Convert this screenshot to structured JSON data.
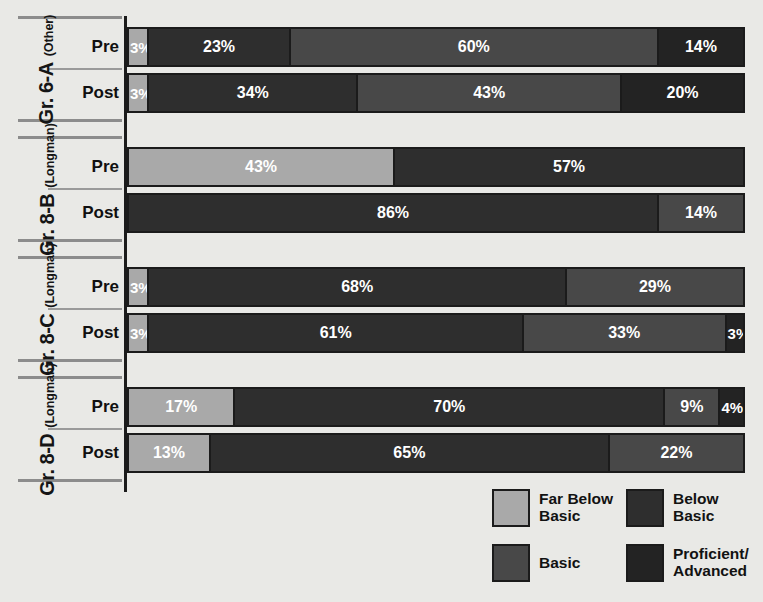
{
  "chart_data": {
    "type": "bar",
    "subtype": "stacked-horizontal-100",
    "title": "",
    "xlabel": "",
    "ylabel": "",
    "xlim": [
      0,
      100
    ],
    "grid": false,
    "legend_position": "bottom-right",
    "value_suffix": "%",
    "legend": [
      {
        "key": "far_below_basic",
        "label": "Far Below\nBasic",
        "color": "#a9a9a9"
      },
      {
        "key": "below_basic",
        "label": "Below\nBasic",
        "color": "#2e2e2e"
      },
      {
        "key": "basic",
        "label": "Basic",
        "color": "#484848"
      },
      {
        "key": "proficient_advanced",
        "label": "Proficient/\nAdvanced",
        "color": "#232323"
      }
    ],
    "categories": [
      "Far Below Basic",
      "Below Basic",
      "Basic",
      "Proficient/Advanced"
    ],
    "groups": [
      {
        "name": "Gr. 6-A",
        "sub": "(Other)",
        "rows": [
          {
            "label": "Pre",
            "values": [
              3,
              23,
              60,
              14
            ]
          },
          {
            "label": "Post",
            "values": [
              3,
              34,
              43,
              20
            ]
          }
        ]
      },
      {
        "name": "Gr. 8-B",
        "sub": "(Longman)",
        "rows": [
          {
            "label": "Pre",
            "values": [
              43,
              57,
              0,
              0
            ]
          },
          {
            "label": "Post",
            "values": [
              0,
              86,
              14,
              0
            ]
          }
        ]
      },
      {
        "name": "Gr. 8-C",
        "sub": "(Longman)",
        "rows": [
          {
            "label": "Pre",
            "values": [
              3,
              68,
              29,
              0
            ]
          },
          {
            "label": "Post",
            "values": [
              3,
              61,
              33,
              3
            ]
          }
        ]
      },
      {
        "name": "Gr. 8-D",
        "sub": "(Longman)",
        "rows": [
          {
            "label": "Pre",
            "values": [
              17,
              70,
              9,
              4
            ]
          },
          {
            "label": "Post",
            "values": [
              13,
              65,
              22,
              0
            ]
          }
        ]
      }
    ]
  },
  "layout": {
    "group_tops": [
      16,
      136,
      256,
      376
    ],
    "group_height": 106,
    "row_offsets": [
      9,
      55
    ]
  }
}
